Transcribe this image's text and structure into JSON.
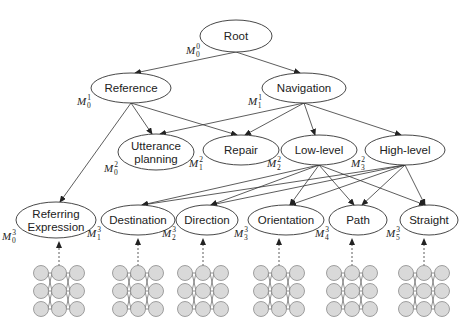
{
  "diagram": {
    "nodes": [
      {
        "id": "root",
        "label_lines": [
          "Root"
        ],
        "model": {
          "base": "M",
          "sup": "0",
          "sub": "0"
        },
        "cx": 236,
        "cy": 36,
        "rx": 36,
        "ry": 16
      },
      {
        "id": "reference",
        "label_lines": [
          "Reference"
        ],
        "model": {
          "base": "M",
          "sup": "1",
          "sub": "0"
        },
        "cx": 131,
        "cy": 88,
        "rx": 40,
        "ry": 15
      },
      {
        "id": "navigation",
        "label_lines": [
          "Navigation"
        ],
        "model": {
          "base": "M",
          "sup": "1",
          "sub": "1"
        },
        "cx": 304,
        "cy": 88,
        "rx": 42,
        "ry": 15
      },
      {
        "id": "utterance",
        "label_lines": [
          "Utterance",
          "planning"
        ],
        "model": {
          "base": "M",
          "sup": "2",
          "sub": "0"
        },
        "cx": 156,
        "cy": 152,
        "rx": 38,
        "ry": 18
      },
      {
        "id": "repair",
        "label_lines": [
          "Repair"
        ],
        "model": {
          "base": "M",
          "sup": "2",
          "sub": "1"
        },
        "cx": 241,
        "cy": 150,
        "rx": 38,
        "ry": 15
      },
      {
        "id": "lowlevel",
        "label_lines": [
          "Low-level"
        ],
        "model": {
          "base": "M",
          "sup": "2",
          "sub": "2"
        },
        "cx": 319,
        "cy": 150,
        "rx": 38,
        "ry": 15
      },
      {
        "id": "highlevel",
        "label_lines": [
          "High-level"
        ],
        "model": {
          "base": "M",
          "sup": "2",
          "sub": "3"
        },
        "cx": 405,
        "cy": 150,
        "rx": 40,
        "ry": 15
      },
      {
        "id": "referring",
        "label_lines": [
          "Referring",
          "Expression"
        ],
        "model": {
          "base": "M",
          "sup": "3",
          "sub": "0"
        },
        "cx": 56,
        "cy": 220,
        "rx": 40,
        "ry": 18
      },
      {
        "id": "destination",
        "label_lines": [
          "Destination"
        ],
        "model": {
          "base": "M",
          "sup": "3",
          "sub": "1"
        },
        "cx": 138,
        "cy": 220,
        "rx": 37,
        "ry": 15
      },
      {
        "id": "direction",
        "label_lines": [
          "Direction"
        ],
        "model": {
          "base": "M",
          "sup": "3",
          "sub": "2"
        },
        "cx": 207,
        "cy": 220,
        "rx": 31,
        "ry": 15
      },
      {
        "id": "orientation",
        "label_lines": [
          "Orientation"
        ],
        "model": {
          "base": "M",
          "sup": "3",
          "sub": "3"
        },
        "cx": 286,
        "cy": 220,
        "rx": 38,
        "ry": 15
      },
      {
        "id": "path",
        "label_lines": [
          "Path"
        ],
        "model": {
          "base": "M",
          "sup": "3",
          "sub": "4"
        },
        "cx": 358,
        "cy": 220,
        "rx": 29,
        "ry": 15
      },
      {
        "id": "straight",
        "label_lines": [
          "Straight"
        ],
        "model": {
          "base": "M",
          "sup": "3",
          "sub": "5"
        },
        "cx": 429,
        "cy": 220,
        "rx": 29,
        "ry": 15
      }
    ],
    "edges": [
      [
        "root",
        "reference"
      ],
      [
        "root",
        "navigation"
      ],
      [
        "reference",
        "utterance"
      ],
      [
        "reference",
        "repair"
      ],
      [
        "reference",
        "referring"
      ],
      [
        "navigation",
        "utterance"
      ],
      [
        "navigation",
        "repair"
      ],
      [
        "navigation",
        "lowlevel"
      ],
      [
        "navigation",
        "highlevel"
      ],
      [
        "lowlevel",
        "destination"
      ],
      [
        "lowlevel",
        "direction"
      ],
      [
        "lowlevel",
        "orientation"
      ],
      [
        "lowlevel",
        "path"
      ],
      [
        "lowlevel",
        "straight"
      ],
      [
        "highlevel",
        "destination"
      ],
      [
        "highlevel",
        "direction"
      ],
      [
        "highlevel",
        "orientation"
      ],
      [
        "highlevel",
        "path"
      ],
      [
        "highlevel",
        "straight"
      ]
    ],
    "neural_nets": [
      {
        "for": "referring",
        "cx": 59
      },
      {
        "for": "destination",
        "cx": 138
      },
      {
        "for": "direction",
        "cx": 203
      },
      {
        "for": "orientation",
        "cx": 279
      },
      {
        "for": "path",
        "cx": 352
      },
      {
        "for": "straight",
        "cx": 424
      }
    ],
    "colors": {
      "stroke": "#333333",
      "neuron_fill": "#d9d9d9",
      "neuron_stroke": "#8a8a8a",
      "text": "#222222"
    }
  }
}
